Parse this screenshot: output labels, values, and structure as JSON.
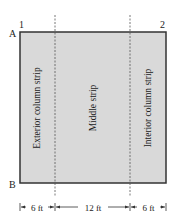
{
  "diagram": {
    "type": "slab-strip-plan",
    "grid_labels": {
      "column_line_1": "1",
      "column_line_2": "2",
      "row_line_a": "A",
      "row_line_b": "B"
    },
    "strips": [
      {
        "name": "exterior-column-strip",
        "label": "Exterior column strip",
        "width_label": "6 ft"
      },
      {
        "name": "middle-strip",
        "label": "Middle strip",
        "width_label": "12 ft"
      },
      {
        "name": "interior-column-strip",
        "label": "Interior column strip",
        "width_label": "6 ft"
      }
    ],
    "colors": {
      "panel_fill": "#d9d9d9",
      "panel_border": "#333333",
      "dashed_line": "#555555",
      "text": "#222222"
    }
  }
}
